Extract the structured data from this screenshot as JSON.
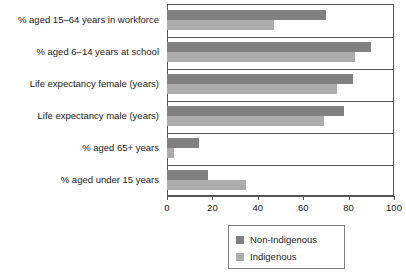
{
  "chart_data": {
    "type": "bar",
    "orientation": "horizontal",
    "title": "",
    "xlabel": "",
    "ylabel": "",
    "xlim": [
      0,
      100
    ],
    "xticks": [
      0,
      20,
      40,
      60,
      80,
      100
    ],
    "grid": false,
    "legend_position": "bottom",
    "categories": [
      "% aged 15–64 years in workforce",
      "% aged 6–14 years at school",
      "Life expectancy female (years)",
      "Life expectancy male (years)",
      "% aged 65+ years",
      "% aged under 15 years"
    ],
    "series": [
      {
        "name": "Non-Indigenous",
        "color": "#808080",
        "values": [
          70,
          90,
          82,
          78,
          14,
          18
        ]
      },
      {
        "name": "Indigenous",
        "color": "#acacac",
        "values": [
          47,
          83,
          75,
          69,
          3,
          35
        ]
      }
    ]
  },
  "legend": {
    "entries": [
      {
        "label": "Non-Indigenous"
      },
      {
        "label": "Indigenous"
      }
    ]
  }
}
